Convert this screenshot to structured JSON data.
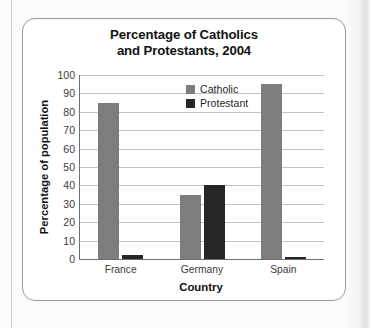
{
  "chart_data": {
    "type": "bar",
    "title": "Percentage of Catholics and Protestants, 2004",
    "title_line1": "Percentage of Catholics",
    "title_line2": "and Protestants, 2004",
    "xlabel": "Country",
    "ylabel": "Percentage of population",
    "categories": [
      "France",
      "Germany",
      "Spain"
    ],
    "series": [
      {
        "name": "Catholic",
        "color": "#7d7d7d",
        "values": [
          85,
          35,
          95
        ]
      },
      {
        "name": "Protestant",
        "color": "#272727",
        "values": [
          2,
          40,
          1
        ]
      }
    ],
    "ylim": [
      0,
      100
    ],
    "yticks": [
      0,
      10,
      20,
      30,
      40,
      50,
      60,
      70,
      80,
      90,
      100
    ],
    "grid": true,
    "legend_position": "inside-top-center"
  },
  "legend": {
    "entries": [
      {
        "label": "Catholic",
        "swatch": "catholic-swatch-icon"
      },
      {
        "label": "Protestant",
        "swatch": "protestant-swatch-icon"
      }
    ]
  }
}
